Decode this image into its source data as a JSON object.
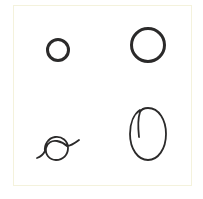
{
  "figure": {
    "background": "#ffffff",
    "border_color": "#f4f2dc",
    "ink_color": "#2b2a2a",
    "layout": "2x2 grid",
    "panels": [
      {
        "id": "top-left",
        "shape": "small-circle",
        "description": "small neat circle",
        "cx": 58,
        "cy": 50,
        "r": 10.5,
        "stroke_width": 3
      },
      {
        "id": "top-right",
        "shape": "large-circle",
        "description": "larger neat circle",
        "cx": 148,
        "cy": 45,
        "r": 16.5,
        "stroke_width": 3
      },
      {
        "id": "bottom-left",
        "shape": "looped-scribble",
        "description": "hand-drawn circle with a loop and tails",
        "stroke_width": 1.8
      },
      {
        "id": "bottom-right",
        "shape": "oval-with-tail",
        "description": "hand-drawn oval with inner starting stroke",
        "cx": 148,
        "cy": 134,
        "rx": 18,
        "ry": 26,
        "stroke_width": 1.8
      }
    ]
  }
}
